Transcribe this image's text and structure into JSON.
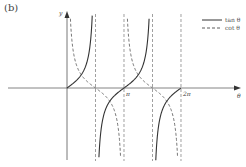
{
  "panel_label": "(b)",
  "chart_data": {
    "type": "line",
    "title": "",
    "xlabel": "θ",
    "ylabel": "y",
    "xlim": [
      -3.2,
      7.3
    ],
    "ylim": [
      -5.6,
      5.6
    ],
    "grid": false,
    "legend_position": "top-right",
    "x_ticks": [
      {
        "value": 3.14159,
        "label": "π"
      },
      {
        "value": 6.28318,
        "label": "2π"
      }
    ],
    "asymptotes": [
      1.5708,
      3.14159,
      4.7124,
      6.28318
    ],
    "series": [
      {
        "name": "tan θ",
        "function": "tan",
        "style": "solid",
        "color": "#333333",
        "branches": [
          [
            0,
            1.5708
          ],
          [
            1.5708,
            4.7124
          ],
          [
            4.7124,
            6.28318
          ]
        ]
      },
      {
        "name": "cot θ",
        "function": "cot",
        "style": "dashed",
        "color": "#555555",
        "branches": [
          [
            0,
            3.14159
          ],
          [
            3.14159,
            6.28318
          ]
        ]
      }
    ],
    "legend": [
      {
        "label": "tan θ",
        "style": "solid"
      },
      {
        "label": "cot θ",
        "style": "dashed"
      }
    ]
  }
}
